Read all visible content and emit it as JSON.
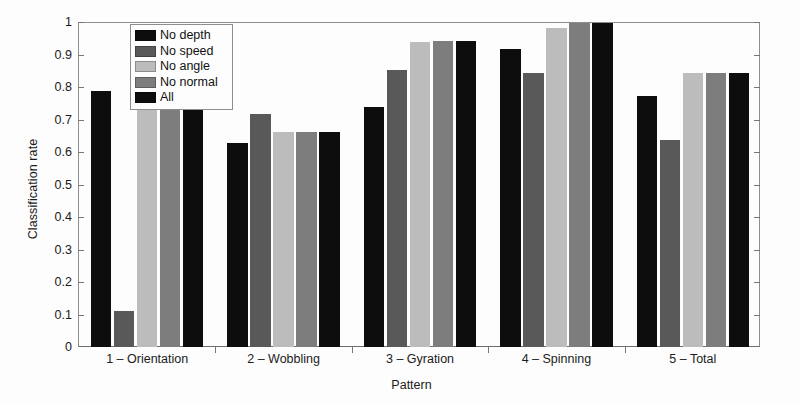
{
  "chart_data": {
    "type": "bar",
    "title": "",
    "xlabel": "Pattern",
    "ylabel": "Classification rate",
    "ylim": [
      0,
      1
    ],
    "yticks": [
      "0",
      "0.1",
      "0.2",
      "0.3",
      "0.4",
      "0.5",
      "0.6",
      "0.7",
      "0.8",
      "0.9",
      "1"
    ],
    "ytick_values": [
      0,
      0.1,
      0.2,
      0.3,
      0.4,
      0.5,
      0.6,
      0.7,
      0.8,
      0.9,
      1.0
    ],
    "grid": false,
    "legend_position": "upper-left-inside",
    "categories": [
      "1 – Orientation",
      "2 – Wobbling",
      "3 – Gyration",
      "4 – Spinning",
      "5 – Total"
    ],
    "series": [
      {
        "name": "No depth",
        "color": "#0d0d0d",
        "values": [
          0.79,
          0.63,
          0.74,
          0.92,
          0.775
        ]
      },
      {
        "name": "No speed",
        "color": "#595959",
        "values": [
          0.11,
          0.72,
          0.855,
          0.845,
          0.64
        ]
      },
      {
        "name": "No angle",
        "color": "#bcbcbc",
        "values": [
          0.75,
          0.665,
          0.94,
          0.985,
          0.845
        ]
      },
      {
        "name": "No normal",
        "color": "#7d7d7d",
        "values": [
          0.75,
          0.665,
          0.945,
          1.0,
          0.845
        ]
      },
      {
        "name": "All",
        "color": "#0d0d0d",
        "values": [
          0.75,
          0.665,
          0.945,
          1.0,
          0.845
        ]
      }
    ]
  }
}
